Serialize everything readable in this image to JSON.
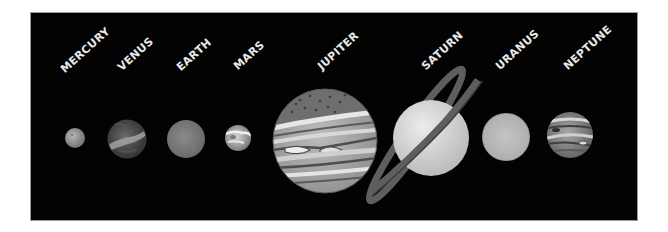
{
  "planets": [
    {
      "name": "MERCURY",
      "cx": 75,
      "cy": 138,
      "r": 10
    },
    {
      "name": "VENUS",
      "cx": 127,
      "cy": 139,
      "r": 19
    },
    {
      "name": "EARTH",
      "cx": 186,
      "cy": 139,
      "r": 19
    },
    {
      "name": "MARS",
      "cx": 238,
      "cy": 138,
      "r": 13
    },
    {
      "name": "JUPITER",
      "cx": 325,
      "cy": 141,
      "r": 52
    },
    {
      "name": "SATURN",
      "cx": 431,
      "cy": 138,
      "r": 38
    },
    {
      "name": "URANUS",
      "cx": 506,
      "cy": 137,
      "r": 24
    },
    {
      "name": "NEPTUNE",
      "cx": 570,
      "cy": 135,
      "r": 23
    }
  ],
  "colors": {
    "background": "#030303",
    "label": "#e8e8e8"
  }
}
